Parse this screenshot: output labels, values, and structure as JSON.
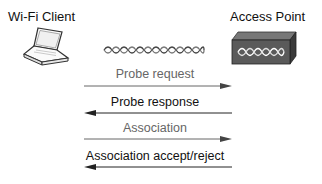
{
  "client": {
    "label": "Wi-Fi Client",
    "icon": "laptop-icon"
  },
  "access_point": {
    "label": "Access Point",
    "icon": "access-point-icon"
  },
  "wireless_link_icon": "wireless-signal-icon",
  "colors": {
    "request": "#666666",
    "response": "#111111",
    "ap_body": "#555555"
  },
  "messages": [
    {
      "label": "Probe request",
      "direction": "client-to-ap",
      "style": "grey"
    },
    {
      "label": "Probe response",
      "direction": "ap-to-client",
      "style": "dark"
    },
    {
      "label": "Association",
      "direction": "client-to-ap",
      "style": "grey"
    },
    {
      "label": "Association accept/reject",
      "direction": "ap-to-client",
      "style": "dark"
    }
  ]
}
